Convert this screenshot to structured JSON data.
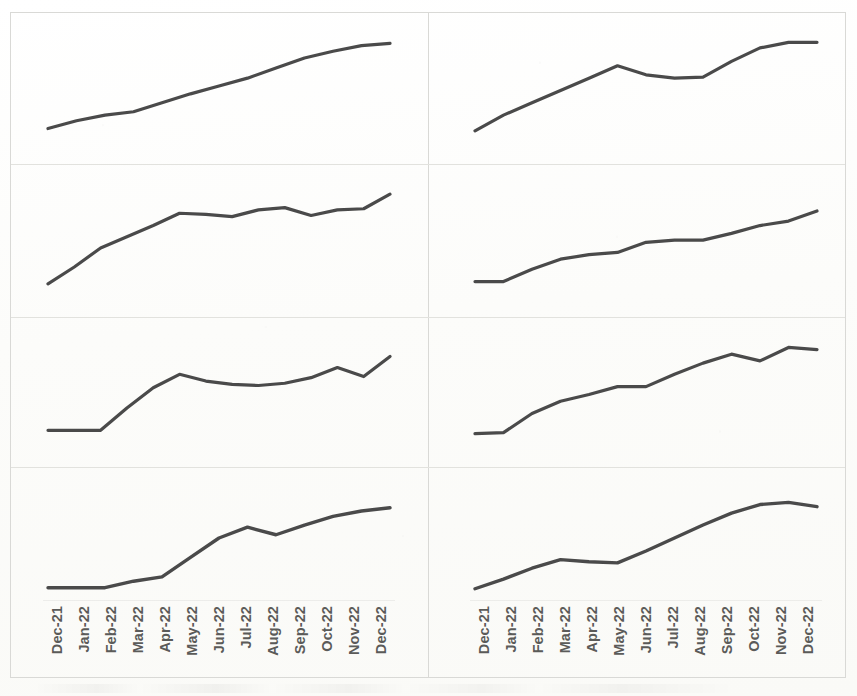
{
  "figure": {
    "title": "",
    "background_color": "#fdfdfc",
    "line_color": "#4a4a4a",
    "frame_color": "#d9d9d6",
    "grid_rows": 4,
    "grid_cols": 2
  },
  "axis": {
    "categories": [
      "Dec-21",
      "Jan-22",
      "Feb-22",
      "Mar-22",
      "Apr-22",
      "May-22",
      "Jun-22",
      "Jul-22",
      "Aug-22",
      "Sep-22",
      "Oct-22",
      "Nov-22",
      "Dec-22"
    ],
    "label_rotation_degrees": -90,
    "label_color": "#5b5b59"
  },
  "chart_data": [
    {
      "id": "panel-1",
      "position": "row1-left",
      "type": "line",
      "title": "",
      "xlabel": "",
      "ylabel": "",
      "grid": false,
      "legend": "none",
      "x": [
        "Dec-21",
        "Jan-22",
        "Feb-22",
        "Mar-22",
        "Apr-22",
        "May-22",
        "Jun-22",
        "Jul-22",
        "Aug-22",
        "Sep-22",
        "Oct-22",
        "Nov-22",
        "Dec-22"
      ],
      "values": [
        12,
        19,
        24,
        27,
        35,
        43,
        50,
        57,
        66,
        75,
        81,
        86,
        88
      ],
      "ylim": [
        0,
        100
      ]
    },
    {
      "id": "panel-2",
      "position": "row1-right",
      "type": "line",
      "title": "",
      "xlabel": "",
      "ylabel": "",
      "grid": false,
      "legend": "none",
      "x": [
        "Dec-21",
        "Jan-22",
        "Feb-22",
        "Mar-22",
        "Apr-22",
        "May-22",
        "Jun-22",
        "Jul-22",
        "Aug-22",
        "Sep-22",
        "Oct-22",
        "Nov-22",
        "Dec-22"
      ],
      "values": [
        10,
        24,
        35,
        46,
        57,
        68,
        60,
        57,
        58,
        72,
        84,
        89,
        89
      ],
      "ylim": [
        0,
        100
      ]
    },
    {
      "id": "panel-3",
      "position": "row2-left",
      "type": "line",
      "title": "",
      "xlabel": "",
      "ylabel": "",
      "grid": false,
      "legend": "none",
      "x": [
        "Dec-21",
        "Jan-22",
        "Feb-22",
        "Mar-22",
        "Apr-22",
        "May-22",
        "Jun-22",
        "Jul-22",
        "Aug-22",
        "Sep-22",
        "Oct-22",
        "Nov-22",
        "Dec-22"
      ],
      "values": [
        10,
        25,
        42,
        52,
        62,
        73,
        72,
        70,
        76,
        78,
        71,
        76,
        77,
        90
      ],
      "ylim": [
        0,
        100
      ]
    },
    {
      "id": "panel-4",
      "position": "row2-right",
      "type": "line",
      "title": "",
      "xlabel": "",
      "ylabel": "",
      "grid": false,
      "legend": "none",
      "x": [
        "Dec-21",
        "Jan-22",
        "Feb-22",
        "Mar-22",
        "Apr-22",
        "May-22",
        "Jun-22",
        "Jul-22",
        "Aug-22",
        "Sep-22",
        "Oct-22",
        "Nov-22",
        "Dec-22"
      ],
      "values": [
        12,
        12,
        23,
        32,
        36,
        38,
        47,
        49,
        49,
        55,
        62,
        66,
        75
      ],
      "ylim": [
        0,
        100
      ]
    },
    {
      "id": "panel-5",
      "position": "row3-left",
      "type": "line",
      "title": "",
      "xlabel": "",
      "ylabel": "",
      "grid": false,
      "legend": "none",
      "x": [
        "Dec-21",
        "Jan-22",
        "Feb-22",
        "Mar-22",
        "Apr-22",
        "May-22",
        "Jun-22",
        "Jul-22",
        "Aug-22",
        "Sep-22",
        "Oct-22",
        "Nov-22",
        "Dec-22"
      ],
      "values": [
        14,
        14,
        14,
        34,
        52,
        64,
        58,
        55,
        54,
        56,
        61,
        70,
        62,
        80
      ],
      "ylim": [
        0,
        100
      ]
    },
    {
      "id": "panel-6",
      "position": "row3-right",
      "type": "line",
      "title": "",
      "xlabel": "",
      "ylabel": "",
      "grid": false,
      "legend": "none",
      "x": [
        "Dec-21",
        "Jan-22",
        "Feb-22",
        "Mar-22",
        "Apr-22",
        "May-22",
        "Jun-22",
        "Jul-22",
        "Aug-22",
        "Sep-22",
        "Oct-22",
        "Nov-22",
        "Dec-22"
      ],
      "values": [
        11,
        12,
        29,
        40,
        46,
        53,
        53,
        64,
        74,
        82,
        76,
        88,
        86
      ],
      "ylim": [
        0,
        100
      ]
    },
    {
      "id": "panel-7",
      "position": "row4-left",
      "type": "line",
      "title": "",
      "xlabel": "",
      "ylabel": "",
      "grid": false,
      "legend": "none",
      "x": [
        "Dec-21",
        "Jan-22",
        "Feb-22",
        "Mar-22",
        "Apr-22",
        "May-22",
        "Jun-22",
        "Jul-22",
        "Aug-22",
        "Sep-22",
        "Oct-22",
        "Nov-22",
        "Dec-22"
      ],
      "values": [
        4,
        4,
        4,
        10,
        14,
        32,
        50,
        60,
        53,
        62,
        70,
        75,
        78
      ],
      "ylim": [
        0,
        100
      ]
    },
    {
      "id": "panel-8",
      "position": "row4-right",
      "type": "line",
      "title": "",
      "xlabel": "",
      "ylabel": "",
      "grid": false,
      "legend": "none",
      "x": [
        "Dec-21",
        "Jan-22",
        "Feb-22",
        "Mar-22",
        "Apr-22",
        "May-22",
        "Jun-22",
        "Jul-22",
        "Aug-22",
        "Sep-22",
        "Oct-22",
        "Nov-22",
        "Dec-22"
      ],
      "values": [
        3,
        12,
        22,
        30,
        28,
        27,
        38,
        50,
        62,
        73,
        81,
        83,
        79
      ],
      "ylim": [
        0,
        100
      ]
    }
  ]
}
